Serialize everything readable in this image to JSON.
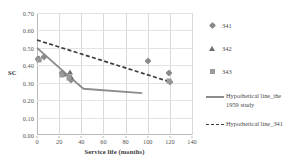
{
  "chart_data": {
    "type": "scatter",
    "title": "",
    "xlabel": "Service life (months)",
    "ylabel": "SC",
    "xlim": [
      0,
      140
    ],
    "ylim": [
      0.0,
      0.7
    ],
    "xticks": [
      "0",
      "20",
      "40",
      "60",
      "80",
      "100",
      "120",
      "140"
    ],
    "xtick_values": [
      0,
      20,
      40,
      60,
      80,
      100,
      120,
      140
    ],
    "yticks": [
      "0.00",
      "0.10",
      "0.20",
      "0.30",
      "0.40",
      "0.50",
      "0.60",
      "0.70"
    ],
    "ytick_values": [
      0.0,
      0.1,
      0.2,
      0.3,
      0.4,
      0.5,
      0.6,
      0.7
    ],
    "grid": "both",
    "legend_position": "right",
    "series": [
      {
        "name": "341",
        "marker": "diamond",
        "color": "#8a8a8a",
        "points": [
          {
            "x": 1,
            "y": 0.435
          },
          {
            "x": 6,
            "y": 0.445
          },
          {
            "x": 23,
            "y": 0.355
          },
          {
            "x": 30,
            "y": 0.325
          },
          {
            "x": 31,
            "y": 0.315
          },
          {
            "x": 100,
            "y": 0.425
          },
          {
            "x": 119,
            "y": 0.355
          },
          {
            "x": 120,
            "y": 0.305
          }
        ]
      },
      {
        "name": "342",
        "marker": "triangle",
        "color": "#6e6e6e",
        "points": [
          {
            "x": 2,
            "y": 0.44
          },
          {
            "x": 24,
            "y": 0.35
          },
          {
            "x": 30,
            "y": 0.36
          },
          {
            "x": 31,
            "y": 0.33
          }
        ]
      },
      {
        "name": "343",
        "marker": "square",
        "color": "#9a9a9a",
        "points": [
          {
            "x": 2,
            "y": 0.43
          },
          {
            "x": 23,
            "y": 0.345
          },
          {
            "x": 29,
            "y": 0.325
          },
          {
            "x": 119,
            "y": 0.31
          }
        ]
      }
    ],
    "lines": [
      {
        "name": "Hypothetical line_the 1959 study",
        "style": "solid",
        "color": "#8c8c8c",
        "points": [
          {
            "x": 0,
            "y": 0.5
          },
          {
            "x": 31,
            "y": 0.325
          },
          {
            "x": 42,
            "y": 0.265
          },
          {
            "x": 95,
            "y": 0.24
          }
        ]
      },
      {
        "name": "Hypothetical line_341",
        "style": "dashed",
        "color": "#3c3c3c",
        "points": [
          {
            "x": 0,
            "y": 0.545
          },
          {
            "x": 120,
            "y": 0.305
          }
        ]
      }
    ]
  },
  "legend": {
    "markers": [
      {
        "label": "341",
        "symbol": "diamond"
      },
      {
        "label": "342",
        "symbol": "triangle"
      },
      {
        "label": "343",
        "symbol": "square"
      }
    ],
    "lines": [
      {
        "label": "Hypothetical line_the 1959 study",
        "style": "solid"
      },
      {
        "label": "Hypothetical line_341",
        "style": "dashed"
      }
    ]
  },
  "axes": {
    "x_title": "Service life (months)",
    "y_title": "SC"
  }
}
